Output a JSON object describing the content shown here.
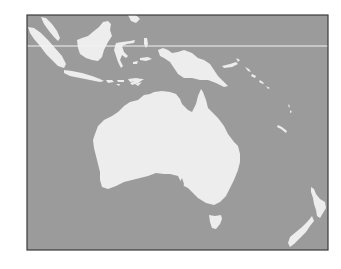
{
  "map": {
    "title": "",
    "region": "Oceania",
    "colors": {
      "ocean": "#9b9b9b",
      "land": "#ededed",
      "frame": "#3a3a3a",
      "equator_line": "#f4f4f4",
      "background": "#ffffff"
    },
    "frame": {
      "x": 27,
      "y": 15,
      "width": 301,
      "height": 235
    },
    "reference_line": {
      "y": 46,
      "type": "horizontal-latitude-line"
    },
    "landmasses": [
      {
        "name": "Australia"
      },
      {
        "name": "Tasmania"
      },
      {
        "name": "New Guinea"
      },
      {
        "name": "Borneo"
      },
      {
        "name": "Sumatra"
      },
      {
        "name": "Java"
      },
      {
        "name": "Sulawesi"
      },
      {
        "name": "Malay Peninsula"
      },
      {
        "name": "Lesser Sunda Islands"
      },
      {
        "name": "New Britain"
      },
      {
        "name": "Solomon Islands"
      },
      {
        "name": "Vanuatu"
      },
      {
        "name": "New Caledonia"
      },
      {
        "name": "New Zealand North Island"
      },
      {
        "name": "New Zealand South Island"
      }
    ]
  }
}
